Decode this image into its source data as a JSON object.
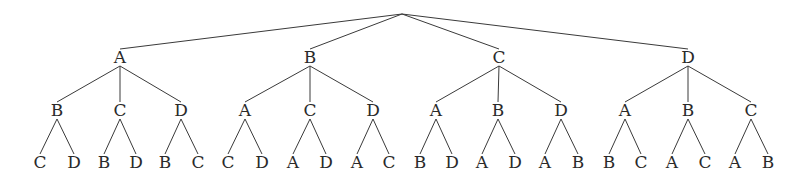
{
  "diagram": {
    "type": "tree",
    "root": {
      "x": 402,
      "y": 14
    },
    "level_y": [
      57,
      110,
      162
    ],
    "nodes": [
      {
        "label": "A",
        "x": 120,
        "children": [
          {
            "label": "B",
            "x": 57,
            "children": [
              {
                "label": "C",
                "x": 40
              },
              {
                "label": "D",
                "x": 74
              }
            ]
          },
          {
            "label": "C",
            "x": 120,
            "children": [
              {
                "label": "B",
                "x": 104
              },
              {
                "label": "D",
                "x": 136
              }
            ]
          },
          {
            "label": "D",
            "x": 181,
            "children": [
              {
                "label": "B",
                "x": 165
              },
              {
                "label": "C",
                "x": 198
              }
            ]
          }
        ]
      },
      {
        "label": "B",
        "x": 310,
        "children": [
          {
            "label": "A",
            "x": 245,
            "children": [
              {
                "label": "C",
                "x": 228
              },
              {
                "label": "D",
                "x": 262
              }
            ]
          },
          {
            "label": "C",
            "x": 310,
            "children": [
              {
                "label": "A",
                "x": 293
              },
              {
                "label": "D",
                "x": 326
              }
            ]
          },
          {
            "label": "D",
            "x": 373,
            "children": [
              {
                "label": "A",
                "x": 357
              },
              {
                "label": "C",
                "x": 389
              }
            ]
          }
        ]
      },
      {
        "label": "C",
        "x": 499,
        "children": [
          {
            "label": "A",
            "x": 436,
            "children": [
              {
                "label": "B",
                "x": 420
              },
              {
                "label": "D",
                "x": 452
              }
            ]
          },
          {
            "label": "B",
            "x": 498,
            "children": [
              {
                "label": "A",
                "x": 482
              },
              {
                "label": "D",
                "x": 515
              }
            ]
          },
          {
            "label": "D",
            "x": 561,
            "children": [
              {
                "label": "A",
                "x": 545
              },
              {
                "label": "B",
                "x": 578
              }
            ]
          }
        ]
      },
      {
        "label": "D",
        "x": 688,
        "children": [
          {
            "label": "A",
            "x": 625,
            "children": [
              {
                "label": "B",
                "x": 609
              },
              {
                "label": "C",
                "x": 641
              }
            ]
          },
          {
            "label": "B",
            "x": 688,
            "children": [
              {
                "label": "A",
                "x": 672
              },
              {
                "label": "C",
                "x": 705
              }
            ]
          },
          {
            "label": "C",
            "x": 751,
            "children": [
              {
                "label": "A",
                "x": 735
              },
              {
                "label": "B",
                "x": 768
              }
            ]
          }
        ]
      }
    ]
  }
}
